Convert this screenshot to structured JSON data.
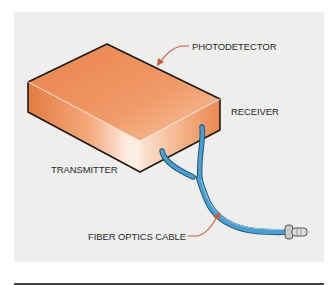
{
  "diagram": {
    "labels": {
      "photodetector": "PHOTODETECTOR",
      "receiver": "RECEIVER",
      "transmitter": "TRANSMITTER",
      "cable": "FIBER OPTICS CABLE"
    },
    "colors": {
      "background": "#eeeeed",
      "box": "#ec8a55",
      "box_highlight": "#fbe3d2",
      "cable": "#4a9fd0",
      "leader": "#c8593a",
      "rule": "#444444"
    }
  }
}
